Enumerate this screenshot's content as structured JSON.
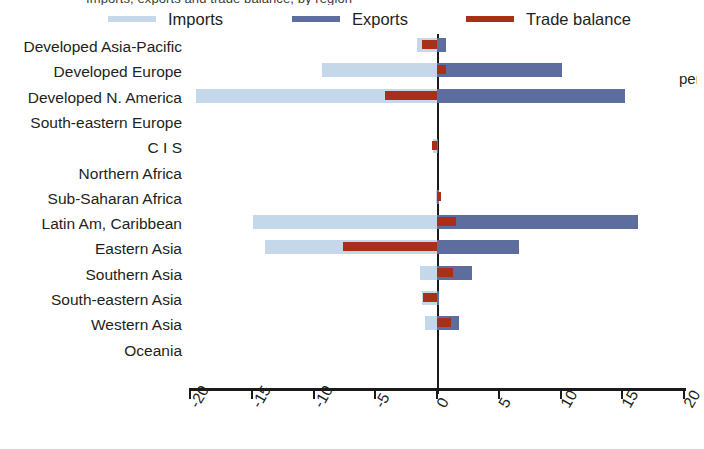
{
  "clipped_header_text": "Imports, exports and trade balance, by region",
  "clipped_right_text": "per",
  "legend": {
    "items": [
      {
        "label": "Imports",
        "color": "#c5d8ea"
      },
      {
        "label": "Exports",
        "color": "#5d6e9e"
      },
      {
        "label": "Trade balance",
        "color": "#a8301b"
      }
    ]
  },
  "axis": {
    "ticks": [
      "-20",
      "-15",
      "-10",
      "-5",
      "0",
      "5",
      "10",
      "15",
      "20"
    ],
    "min": -20,
    "max": 20,
    "step": 5
  },
  "chart_data": {
    "type": "bar",
    "orientation": "horizontal",
    "title": "Imports, exports and trade balance, by region",
    "xlabel": "",
    "ylabel": "",
    "xlim": [
      -20,
      20
    ],
    "xticks": [
      -20,
      -15,
      -10,
      -5,
      0,
      5,
      10,
      15,
      20
    ],
    "grid": false,
    "legend_position": "top",
    "categories": [
      "Developed Asia-Pacific",
      "Developed Europe",
      "Developed N. America",
      "South-eastern Europe",
      "C I S",
      "Northern Africa",
      "Sub-Saharan Africa",
      "Latin Am, Caribbean",
      "Eastern Asia",
      "Southern Asia",
      "South-eastern Asia",
      "Western Asia",
      "Oceania"
    ],
    "series": [
      {
        "name": "Imports",
        "color": "#c5d8ea",
        "values": [
          -1.6,
          -9.3,
          -19.5,
          0.0,
          -0.3,
          0.0,
          -0.1,
          -14.9,
          -13.9,
          -1.4,
          -1.2,
          -1.0,
          0.0
        ]
      },
      {
        "name": "Exports",
        "color": "#5d6e9e",
        "values": [
          0.7,
          10.1,
          15.2,
          0.0,
          0.1,
          0.0,
          0.2,
          16.3,
          6.6,
          2.8,
          0.2,
          1.8,
          0.0
        ]
      },
      {
        "name": "Trade balance",
        "color": "#a8301b",
        "values": [
          -1.2,
          0.7,
          -4.2,
          0.0,
          -0.4,
          0.0,
          0.3,
          1.5,
          -7.6,
          1.3,
          -1.1,
          1.1,
          0.0
        ]
      }
    ]
  }
}
